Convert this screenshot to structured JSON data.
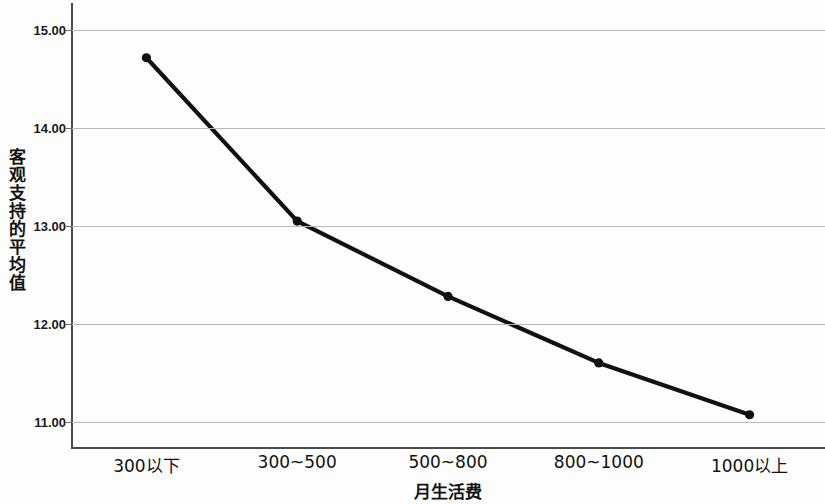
{
  "chart_data": {
    "type": "line",
    "title": "",
    "xlabel": "月生活费",
    "ylabel": "客观支持的平均值",
    "categories": [
      "300以下",
      "300~500",
      "500~800",
      "800~1000",
      "1000以上"
    ],
    "values": [
      14.72,
      13.05,
      12.28,
      11.6,
      11.07
    ],
    "series": [
      {
        "name": "客观支持的平均值",
        "values": [
          14.72,
          13.05,
          12.28,
          11.6,
          11.07
        ]
      }
    ],
    "ylim": [
      10.72,
      15.28
    ],
    "yticks": [
      15.0,
      14.0,
      13.0,
      12.0,
      11.0
    ],
    "ytick_labels": [
      "15.00",
      "14.00",
      "13.00",
      "12.00",
      "11.00"
    ],
    "grid": true,
    "legend": "none",
    "marker": "circle",
    "line_color": "#111111",
    "marker_color": "#111111",
    "grid_color": "#b9b9b9",
    "axis_color": "#4a4a4a",
    "background": "#fdfdfd"
  },
  "axes": {
    "y_title_chars": [
      "客",
      "观",
      "支",
      "持",
      "的",
      "平",
      "均",
      "值"
    ],
    "x_title": "月生活费"
  }
}
